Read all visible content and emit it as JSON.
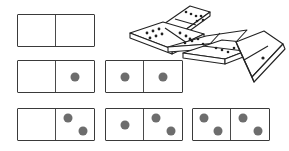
{
  "figure": {
    "background_color": "#ffffff",
    "tile_border_color": "#3a3a3a",
    "tile_face_color": "#ffffff",
    "pip_color": "#6d6d6d",
    "divider_color": "#4a4a4a",
    "pile_line_color": "#222222"
  },
  "tiles": [
    {
      "id": "domino-0-0",
      "name": "double-blank",
      "label": "0-0",
      "left_value": 0,
      "right_value": 0,
      "row": 1,
      "column": 1,
      "x": 17,
      "y": 14,
      "width": 78,
      "height": 33,
      "left_pips": [],
      "right_pips": []
    },
    {
      "id": "domino-0-1",
      "name": "blank-one",
      "label": "0-1",
      "left_value": 0,
      "right_value": 1,
      "row": 2,
      "column": 1,
      "x": 17,
      "y": 60,
      "width": 78,
      "height": 33,
      "left_pips": [],
      "right_pips": [
        {
          "cx": 50,
          "cy": 50
        }
      ]
    },
    {
      "id": "domino-1-1",
      "name": "double-one",
      "label": "1-1",
      "left_value": 1,
      "right_value": 1,
      "row": 2,
      "column": 2,
      "x": 105,
      "y": 60,
      "width": 78,
      "height": 33,
      "left_pips": [
        {
          "cx": 50,
          "cy": 50
        }
      ],
      "right_pips": [
        {
          "cx": 50,
          "cy": 50
        }
      ]
    },
    {
      "id": "domino-0-2",
      "name": "blank-two",
      "label": "0-2",
      "left_value": 0,
      "right_value": 2,
      "row": 3,
      "column": 1,
      "x": 17,
      "y": 108,
      "width": 78,
      "height": 33,
      "left_pips": [],
      "right_pips": [
        {
          "cx": 32,
          "cy": 30
        },
        {
          "cx": 70,
          "cy": 70
        }
      ]
    },
    {
      "id": "domino-1-2",
      "name": "one-two",
      "label": "1-2",
      "left_value": 1,
      "right_value": 2,
      "row": 3,
      "column": 2,
      "x": 105,
      "y": 108,
      "width": 78,
      "height": 33,
      "left_pips": [
        {
          "cx": 50,
          "cy": 52
        }
      ],
      "right_pips": [
        {
          "cx": 32,
          "cy": 30
        },
        {
          "cx": 70,
          "cy": 70
        }
      ]
    },
    {
      "id": "domino-2-2",
      "name": "double-two",
      "label": "2-2",
      "left_value": 2,
      "right_value": 2,
      "row": 3,
      "column": 3,
      "x": 192,
      "y": 108,
      "width": 78,
      "height": 33,
      "left_pips": [
        {
          "cx": 30,
          "cy": 30
        },
        {
          "cx": 68,
          "cy": 72
        }
      ],
      "right_pips": [
        {
          "cx": 32,
          "cy": 28
        },
        {
          "cx": 70,
          "cy": 70
        }
      ]
    }
  ],
  "pile": {
    "name": "scattered-domino-pile",
    "description": "Isometric drawing of five dominoes loosely stacked and fanned out",
    "piece_count": 5,
    "pieces": [
      {
        "id": "pile-piece-top",
        "name": "pile-domino-top",
        "pips_visible": 6
      },
      {
        "id": "pile-piece-upper-left",
        "name": "pile-domino-upper-left",
        "pips_visible": 9
      },
      {
        "id": "pile-piece-middle",
        "name": "pile-domino-middle",
        "pips_visible": 8
      },
      {
        "id": "pile-piece-lower-right",
        "name": "pile-domino-lower-right",
        "pips_visible": 4
      },
      {
        "id": "pile-piece-tilted",
        "name": "pile-domino-tilted",
        "pips_visible": 1
      }
    ]
  }
}
